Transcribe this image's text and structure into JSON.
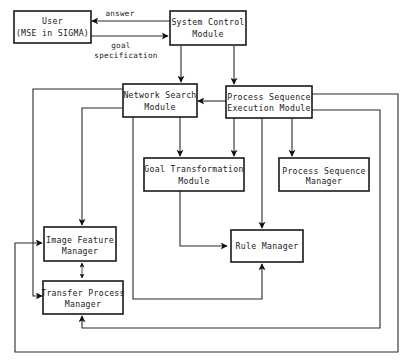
{
  "diagram": {
    "type": "block-diagram",
    "nodes": {
      "user": {
        "line1": "User",
        "line2": "(MSE in SIGMA)"
      },
      "system_control": {
        "line1": "System Control",
        "line2": "Module"
      },
      "network_search": {
        "line1": "Network Search",
        "line2": "Module"
      },
      "process_seq_exec": {
        "line1": "Process Sequence",
        "line2": "Execution Module"
      },
      "goal_transformation": {
        "line1": "Goal Transformation",
        "line2": "Module"
      },
      "process_seq_manager": {
        "line1": "Process Sequence",
        "line2": "Manager"
      },
      "rule_manager": {
        "line1": "Rule Manager"
      },
      "image_feature": {
        "line1": "Image Feature",
        "line2": "Manager"
      },
      "transfer_process": {
        "line1": "Transfer Process",
        "line2": "Manager"
      }
    },
    "edge_labels": {
      "answer": "answer",
      "goal_spec_1": "goal",
      "goal_spec_2": "specification"
    },
    "edges": [
      {
        "from": "System Control Module",
        "to": "User (MSE in SIGMA)",
        "label": "answer"
      },
      {
        "from": "User (MSE in SIGMA)",
        "to": "System Control Module",
        "label": "goal specification"
      },
      {
        "from": "System Control Module",
        "to": "Network Search Module"
      },
      {
        "from": "System Control Module",
        "to": "Process Sequence Execution Module"
      },
      {
        "from": "Process Sequence Execution Module",
        "to": "Network Search Module"
      },
      {
        "from": "Network Search Module",
        "to": "Goal Transformation Module"
      },
      {
        "from": "Network Search Module",
        "to": "Image Feature Manager"
      },
      {
        "from": "Network Search Module",
        "to": "Transfer Process Manager"
      },
      {
        "from": "Network Search Module",
        "to": "Rule Manager"
      },
      {
        "from": "Process Sequence Execution Module",
        "to": "Goal Transformation Module"
      },
      {
        "from": "Process Sequence Execution Module",
        "to": "Rule Manager"
      },
      {
        "from": "Process Sequence Execution Module",
        "to": "Process Sequence Manager"
      },
      {
        "from": "Process Sequence Execution Module",
        "to": "Transfer Process Manager"
      },
      {
        "from": "Process Sequence Execution Module",
        "to": "Image Feature Manager"
      },
      {
        "from": "Goal Transformation Module",
        "to": "Rule Manager"
      },
      {
        "from": "Image Feature Manager",
        "to": "Transfer Process Manager",
        "bidirectional": true
      }
    ]
  }
}
